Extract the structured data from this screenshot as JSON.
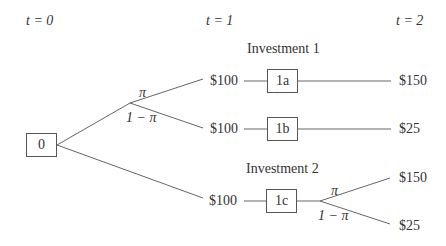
{
  "time_labels": {
    "t0": "t = 0",
    "t1": "t = 1",
    "t2": "t = 2"
  },
  "sections": {
    "inv1": "Investment 1",
    "inv2": "Investment 2"
  },
  "nodes": {
    "root": "0",
    "n1a": "1a",
    "n1b": "1b",
    "n1c": "1c"
  },
  "values": {
    "v1a_t1": "$100",
    "v1b_t1": "$100",
    "v1c_t1": "$100",
    "v1a_t2": "$150",
    "v1b_t2": "$25",
    "v1c_up_t2": "$150",
    "v1c_down_t2": "$25"
  },
  "probabilities": {
    "p": "π",
    "q": "1 − π"
  }
}
